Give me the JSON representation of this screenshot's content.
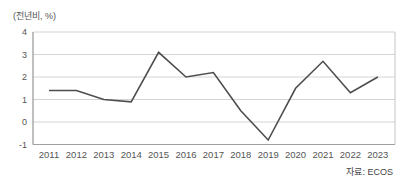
{
  "unit_label": "(전년비, %)",
  "source_label": "자료: ECOS",
  "chart_data": {
    "type": "line",
    "title": "",
    "unit": "(전년비, %)",
    "source": "자료: ECOS",
    "x": [
      2011,
      2012,
      2013,
      2014,
      2015,
      2016,
      2017,
      2018,
      2019,
      2020,
      2021,
      2022,
      2023
    ],
    "values": [
      1.4,
      1.4,
      1.0,
      0.9,
      3.1,
      2.0,
      2.2,
      0.5,
      -0.8,
      1.5,
      2.7,
      1.3,
      2.0
    ],
    "ylim": [
      -1,
      4
    ],
    "yticks": [
      4,
      3,
      2,
      1,
      0,
      -1
    ],
    "grid": true,
    "legend": "none",
    "colors": {
      "line": "#4d4d4d",
      "grid": "#d4d4d4",
      "axis_left": "#808080",
      "axis_bottom": "#a0a0a0",
      "border_right": "#c4c4c4",
      "tick_text": "#555555"
    }
  }
}
